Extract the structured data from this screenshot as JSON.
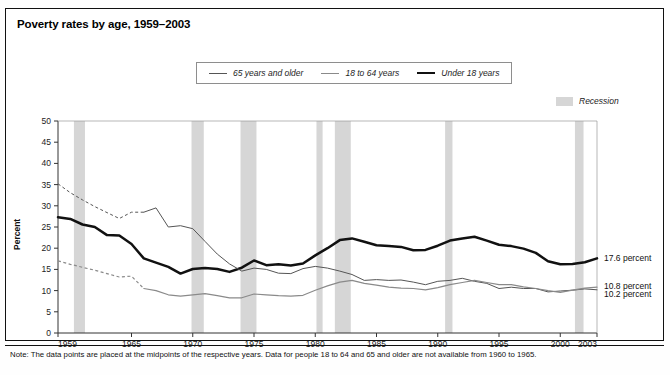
{
  "title": "Poverty rates by age, 1959–2003",
  "legend": {
    "items": [
      {
        "label": "65 years and older",
        "style": "thin",
        "color": "#555555"
      },
      {
        "label": "18 to 64 years",
        "style": "mid",
        "color": "#8a8a8a"
      },
      {
        "label": "Under 18 years",
        "style": "thick",
        "color": "#111111"
      }
    ],
    "recession_label": "Recession",
    "recession_color": "#d6d6d6"
  },
  "note": "Note: The data points are placed at the midpoints of the respective years. Data for people 18 to 64 and 65 and older are not available from 1960 to 1965.",
  "end_labels": [
    {
      "text": "17.6 percent",
      "series": "Under 18 years"
    },
    {
      "text": "10.8 percent",
      "series": "65 years and older"
    },
    {
      "text": "10.2 percent",
      "series": "18 to 64 years"
    }
  ],
  "chart_data": {
    "type": "line",
    "title": "Poverty rates by age, 1959–2003",
    "xlabel": "",
    "ylabel": "Percent",
    "xlim": [
      1959,
      2003
    ],
    "ylim": [
      0,
      50
    ],
    "yticks": [
      0,
      5,
      10,
      15,
      20,
      25,
      30,
      35,
      40,
      45,
      50
    ],
    "xticks": [
      1959,
      1965,
      1970,
      1975,
      1980,
      1985,
      1990,
      1995,
      2000,
      2003
    ],
    "grid": false,
    "legend_position": "top-center",
    "x": [
      1959,
      1960,
      1961,
      1962,
      1963,
      1964,
      1965,
      1966,
      1967,
      1968,
      1969,
      1970,
      1971,
      1972,
      1973,
      1974,
      1975,
      1976,
      1977,
      1978,
      1979,
      1980,
      1981,
      1982,
      1983,
      1984,
      1985,
      1986,
      1987,
      1988,
      1989,
      1990,
      1991,
      1992,
      1993,
      1994,
      1995,
      1996,
      1997,
      1998,
      1999,
      2000,
      2001,
      2002,
      2003
    ],
    "series": [
      {
        "name": "Under 18 years",
        "color": "#111111",
        "width": 2.5,
        "dashed_until": null,
        "values": [
          27.3,
          26.9,
          25.6,
          25.0,
          23.1,
          23.0,
          21.0,
          17.6,
          16.6,
          15.6,
          14.0,
          15.1,
          15.3,
          15.1,
          14.4,
          15.4,
          17.1,
          16.0,
          16.2,
          15.9,
          16.4,
          18.3,
          20.0,
          21.9,
          22.3,
          21.5,
          20.7,
          20.5,
          20.3,
          19.5,
          19.6,
          20.6,
          21.8,
          22.3,
          22.7,
          21.8,
          20.8,
          20.5,
          19.9,
          18.9,
          16.9,
          16.2,
          16.3,
          16.7,
          17.6
        ]
      },
      {
        "name": "65 years and older",
        "color": "#555555",
        "width": 1.0,
        "dashed_until": 1966,
        "values": [
          35.2,
          33.1,
          31.4,
          29.8,
          28.4,
          27.0,
          28.5,
          28.5,
          29.5,
          25.0,
          25.3,
          24.6,
          21.6,
          18.6,
          16.3,
          14.6,
          15.3,
          15.0,
          14.1,
          14.0,
          15.2,
          15.7,
          15.3,
          14.6,
          13.8,
          12.4,
          12.6,
          12.4,
          12.5,
          12.0,
          11.4,
          12.2,
          12.4,
          12.9,
          12.2,
          11.7,
          10.5,
          10.8,
          10.5,
          10.5,
          9.7,
          9.9,
          10.1,
          10.4,
          10.2
        ]
      },
      {
        "name": "18 to 64 years",
        "color": "#8a8a8a",
        "width": 1.2,
        "dashed_until": 1966,
        "values": [
          17.0,
          16.2,
          15.5,
          14.8,
          14.0,
          13.2,
          13.4,
          10.5,
          10.0,
          9.0,
          8.7,
          9.0,
          9.3,
          8.8,
          8.3,
          8.3,
          9.2,
          9.0,
          8.8,
          8.7,
          8.9,
          10.1,
          11.1,
          12.0,
          12.4,
          11.7,
          11.3,
          10.8,
          10.6,
          10.5,
          10.2,
          10.7,
          11.4,
          11.9,
          12.4,
          11.9,
          11.4,
          11.4,
          10.9,
          10.5,
          10.0,
          9.6,
          10.1,
          10.6,
          10.8
        ]
      }
    ],
    "recessions": [
      {
        "start": 1960.3,
        "end": 1961.2
      },
      {
        "start": 1969.9,
        "end": 1970.9
      },
      {
        "start": 1973.9,
        "end": 1975.2
      },
      {
        "start": 1980.1,
        "end": 1980.6
      },
      {
        "start": 1981.6,
        "end": 1982.9
      },
      {
        "start": 1990.6,
        "end": 1991.2
      },
      {
        "start": 2001.2,
        "end": 2001.9
      }
    ]
  }
}
